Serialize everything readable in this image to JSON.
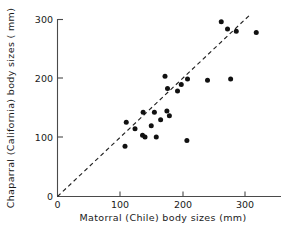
{
  "chart_data": {
    "type": "scatter",
    "title": "",
    "xlabel": "Matorral (Chile) body sizes  (mm)",
    "ylabel": "Chaparral (California) body sizes ( mm)",
    "xlim": [
      0,
      345
    ],
    "ylim": [
      0,
      312
    ],
    "xticks": [
      0,
      100,
      200,
      300
    ],
    "xtick_labels": [
      "0",
      "100",
      "200",
      "300"
    ],
    "yticks": [
      0,
      100,
      200,
      300
    ],
    "ytick_labels": [
      "0",
      "100",
      "200",
      "300"
    ],
    "grid": false,
    "legend": false,
    "annotations": [
      {
        "name": "one-to-one-reference-line",
        "type": "dashed-line",
        "from": [
          0,
          0
        ],
        "to": [
          310,
          310
        ],
        "style": "dashed"
      }
    ],
    "series": [
      {
        "name": "species-body-size-pairs",
        "marker": "filled-circle",
        "color": "#111111",
        "points": [
          [
            108,
            85
          ],
          [
            110,
            126
          ],
          [
            124,
            115
          ],
          [
            136,
            104
          ],
          [
            140,
            101
          ],
          [
            137,
            143
          ],
          [
            155,
            143
          ],
          [
            158,
            101
          ],
          [
            172,
            204
          ],
          [
            175,
            145
          ],
          [
            176,
            183
          ],
          [
            179,
            137
          ],
          [
            192,
            179
          ],
          [
            207,
            95
          ],
          [
            208,
            199
          ],
          [
            240,
            197
          ],
          [
            262,
            296
          ],
          [
            272,
            284
          ],
          [
            277,
            199
          ],
          [
            286,
            280
          ],
          [
            318,
            278
          ],
          [
            150,
            120
          ],
          [
            165,
            130
          ],
          [
            198,
            190
          ]
        ]
      }
    ]
  },
  "axes": {
    "x_title": "Matorral (Chile) body sizes  (mm)",
    "y_title": "Chaparral (California) body sizes ( mm)",
    "x_tick_labels": [
      "0",
      "100",
      "200",
      "300"
    ],
    "y_tick_labels": [
      "0",
      "100",
      "200",
      "300"
    ]
  },
  "colors": {
    "marker": "#111111",
    "axis": "#4a4a4a",
    "reference_line": "#222222",
    "background": "#ffffff"
  }
}
